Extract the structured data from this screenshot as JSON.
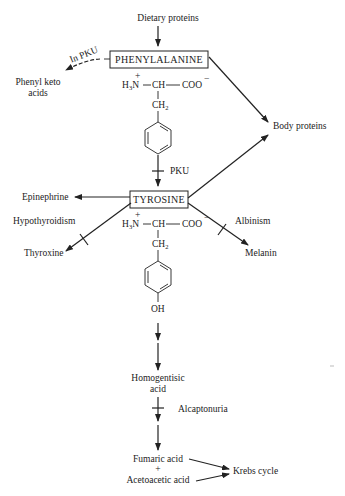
{
  "diagram": {
    "type": "metabolic-pathway",
    "nodes": {
      "dietary_proteins": "Dietary proteins",
      "phenylalanine": "PHENYLALANINE",
      "phenyl_keto_acids_1": "Phenyl keto",
      "phenyl_keto_acids_2": "acids",
      "body_proteins": "Body proteins",
      "tyrosine": "TYROSINE",
      "epinephrine": "Epinephrine",
      "thyroxine": "Thyroxine",
      "melanin": "Melanin",
      "homogentisic_1": "Homogentisic",
      "homogentisic_2": "acid",
      "fumaric_acid": "Fumaric acid",
      "plus": "+",
      "acetoacetic_acid": "Acetoacetic acid",
      "krebs_cycle": "Krebs cycle"
    },
    "edge_labels": {
      "in_pku": "In PKU",
      "pku": "PKU",
      "hypothyroidism": "Hypothyroidism",
      "albinism": "Albinism",
      "alcaptonuria": "Alcaptonuria"
    },
    "structures": {
      "phenylalanine": {
        "amine": "H",
        "amine_sub": "3",
        "amine_n": "N",
        "charge_plus": "+",
        "alpha": "—CH—",
        "carboxyl": "COO",
        "charge_minus": "−",
        "ch2": "CH",
        "ch2_sub": "2"
      },
      "tyrosine": {
        "amine": "H",
        "amine_sub": "3",
        "amine_n": "N",
        "charge_plus": "+",
        "alpha": "—CH—",
        "carboxyl": "COO",
        "charge_minus": "−",
        "ch2": "CH",
        "ch2_sub": "2",
        "hydroxyl": "OH"
      }
    },
    "edges": [
      {
        "from": "Dietary proteins",
        "to": "PHENYLALANINE"
      },
      {
        "from": "PHENYLALANINE",
        "to": "Phenyl keto acids",
        "label": "In PKU",
        "style": "dashed"
      },
      {
        "from": "PHENYLALANINE",
        "to": "Body proteins"
      },
      {
        "from": "PHENYLALANINE",
        "to": "TYROSINE",
        "block": "PKU"
      },
      {
        "from": "TYROSINE",
        "to": "Body proteins"
      },
      {
        "from": "TYROSINE",
        "to": "Epinephrine"
      },
      {
        "from": "TYROSINE",
        "to": "Thyroxine",
        "block": "Hypothyroidism"
      },
      {
        "from": "TYROSINE",
        "to": "Melanin",
        "block": "Albinism"
      },
      {
        "from": "TYROSINE",
        "to": "Homogentisic acid"
      },
      {
        "from": "Homogentisic acid",
        "to": "Fumaric acid + Acetoacetic acid",
        "block": "Alcaptonuria"
      },
      {
        "from": "Fumaric acid",
        "to": "Krebs cycle"
      },
      {
        "from": "Acetoacetic acid",
        "to": "Krebs cycle"
      }
    ]
  }
}
